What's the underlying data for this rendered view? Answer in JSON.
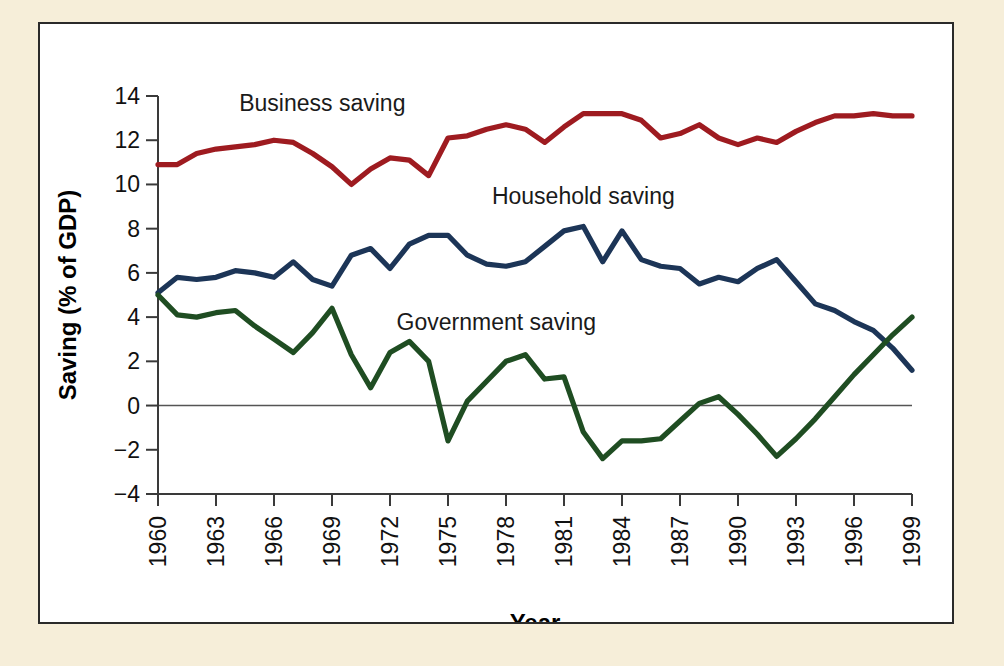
{
  "figure": {
    "background_color": "#f6eed9",
    "panel_background": "#ffffff",
    "panel_border_color": "#2a2a2a"
  },
  "chart_data": {
    "type": "line",
    "title": "",
    "xlabel": "Year",
    "ylabel": "Saving (% of GDP)",
    "xlim": [
      1960,
      1999
    ],
    "ylim": [
      -4,
      14
    ],
    "yticks": [
      -4,
      -2,
      0,
      2,
      4,
      6,
      8,
      10,
      12,
      14
    ],
    "ytick_labels": [
      "−4",
      "−2",
      "0",
      "2",
      "4",
      "6",
      "8",
      "10",
      "12",
      "14"
    ],
    "xticks": [
      1960,
      1963,
      1966,
      1969,
      1972,
      1975,
      1978,
      1981,
      1984,
      1987,
      1990,
      1993,
      1996,
      1999
    ],
    "xtick_labels": [
      "1960",
      "1963",
      "1966",
      "1969",
      "1972",
      "1975",
      "1978",
      "1981",
      "1984",
      "1987",
      "1990",
      "1993",
      "1996",
      "1999"
    ],
    "xtick_rotation": 90,
    "grid": false,
    "zero_line": true,
    "legend_position": "inline-annotations",
    "x": [
      1960,
      1961,
      1962,
      1963,
      1964,
      1965,
      1966,
      1967,
      1968,
      1969,
      1970,
      1971,
      1972,
      1973,
      1974,
      1975,
      1976,
      1977,
      1978,
      1979,
      1980,
      1981,
      1982,
      1983,
      1984,
      1985,
      1986,
      1987,
      1988,
      1989,
      1990,
      1991,
      1992,
      1993,
      1994,
      1995,
      1996,
      1997,
      1998,
      1999
    ],
    "series": [
      {
        "name": "Business saving",
        "color": "#9e1b20",
        "label_x": 1968.5,
        "label_y": 13.3,
        "values": [
          10.9,
          10.9,
          11.4,
          11.6,
          11.7,
          11.8,
          12.0,
          11.9,
          11.4,
          10.8,
          10.0,
          10.7,
          11.2,
          11.1,
          10.4,
          12.1,
          12.2,
          12.5,
          12.7,
          12.5,
          11.9,
          12.6,
          13.2,
          13.2,
          13.2,
          12.9,
          12.1,
          12.3,
          12.7,
          12.1,
          11.8,
          12.1,
          11.9,
          12.4,
          12.8,
          13.1,
          13.1,
          13.2,
          13.1,
          13.1
        ]
      },
      {
        "name": "Household saving",
        "color": "#1c3557",
        "label_x": 1982.0,
        "label_y": 9.1,
        "values": [
          5.1,
          5.8,
          5.7,
          5.8,
          6.1,
          6.0,
          5.8,
          6.5,
          5.7,
          5.4,
          6.8,
          7.1,
          6.2,
          7.3,
          7.7,
          7.7,
          6.8,
          6.4,
          6.3,
          6.5,
          7.2,
          7.9,
          8.1,
          6.5,
          7.9,
          6.6,
          6.3,
          6.2,
          5.5,
          5.8,
          5.6,
          6.2,
          6.6,
          5.6,
          4.6,
          4.3,
          3.8,
          3.4,
          2.6,
          1.6
        ]
      },
      {
        "name": "Government saving",
        "color": "#1f4d22",
        "label_x": 1977.5,
        "label_y": 3.4,
        "values": [
          5.0,
          4.1,
          4.0,
          4.2,
          4.3,
          3.6,
          3.0,
          2.4,
          3.3,
          4.4,
          2.3,
          0.8,
          2.4,
          2.9,
          2.0,
          -1.6,
          0.2,
          1.1,
          2.0,
          2.3,
          1.2,
          1.3,
          -1.2,
          -2.4,
          -1.6,
          -1.6,
          -1.5,
          -0.7,
          0.1,
          0.4,
          -0.4,
          -1.3,
          -2.3,
          -1.5,
          -0.6,
          0.4,
          1.4,
          2.3,
          3.2,
          4.0
        ]
      }
    ]
  }
}
